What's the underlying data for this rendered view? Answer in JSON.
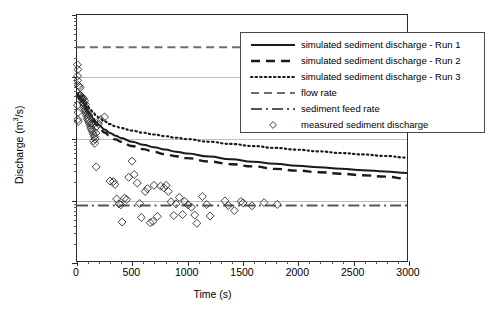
{
  "chart_data": {
    "type": "scatter",
    "title": "",
    "xlabel": "Time (s)",
    "ylabel_text": "Discharge (m",
    "ylabel_sup": "3",
    "ylabel_tail": "/s)",
    "ylabel_full": "Discharge (m3/s)",
    "xlim": [
      0,
      3000
    ],
    "ylim": [
      1e-07,
      0.001
    ],
    "yscale": "log",
    "grid": "horizontal-major",
    "legend_position": "upper-right-inside",
    "xticks": [
      0,
      500,
      1000,
      1500,
      2000,
      2500,
      3000
    ],
    "xtick_labels": [
      "0",
      "500",
      "1000",
      "1500",
      "2000",
      "2500",
      "3000"
    ],
    "xtick_minor_step": 100,
    "yticks": [
      0.001,
      0.0001,
      1e-05,
      1e-06,
      1e-07
    ],
    "ytick_labels": [
      "1.E-03",
      "1.E-04",
      "1.E-05",
      "1.E-06",
      "1.E-07"
    ],
    "series": [
      {
        "name": "simulated sediment discharge - Run 1",
        "style": "solid",
        "color": "#1a1a1a",
        "width": 2.0,
        "x": [
          0,
          25,
          50,
          75,
          100,
          125,
          150,
          175,
          200,
          250,
          300,
          350,
          400,
          500,
          600,
          700,
          800,
          900,
          1000,
          1200,
          1400,
          1600,
          1800,
          2000,
          2200,
          2400,
          2600,
          2800,
          3000
        ],
        "y": [
          5.2e-05,
          4.7e-05,
          4e-05,
          3.3e-05,
          2.75e-05,
          2.35e-05,
          2.05e-05,
          1.82e-05,
          1.63e-05,
          1.38e-05,
          1.21e-05,
          1.09e-05,
          1e-05,
          8.7e-06,
          7.8e-06,
          7.1e-06,
          6.5e-06,
          6e-06,
          5.6e-06,
          5e-06,
          4.5e-06,
          4.1e-06,
          3.8e-06,
          3.55e-06,
          3.35e-06,
          3.15e-06,
          3e-06,
          2.85e-06,
          2.7e-06
        ]
      },
      {
        "name": "simulated sediment discharge - Run 2",
        "style": "dashed",
        "color": "#1a1a1a",
        "width": 2.4,
        "x": [
          0,
          25,
          50,
          75,
          100,
          125,
          150,
          175,
          200,
          250,
          300,
          350,
          400,
          500,
          600,
          700,
          800,
          900,
          1000,
          1200,
          1400,
          1600,
          1800,
          2000,
          2200,
          2400,
          2600,
          2800,
          3000
        ],
        "y": [
          5e-05,
          4.4e-05,
          3.7e-05,
          3.05e-05,
          2.55e-05,
          2.15e-05,
          1.87e-05,
          1.65e-05,
          1.47e-05,
          1.23e-05,
          1.07e-05,
          9.5e-06,
          8.7e-06,
          7.4e-06,
          6.6e-06,
          5.95e-06,
          5.45e-06,
          5.05e-06,
          4.7e-06,
          4.15e-06,
          3.75e-06,
          3.45e-06,
          3.15e-06,
          2.95e-06,
          2.78e-06,
          2.62e-06,
          2.48e-06,
          2.35e-06,
          2.2e-06
        ]
      },
      {
        "name": "simulated sediment discharge - Run 3",
        "style": "dotted",
        "color": "#1a1a1a",
        "width": 2.2,
        "x": [
          0,
          25,
          50,
          75,
          100,
          125,
          150,
          175,
          200,
          250,
          300,
          350,
          400,
          500,
          600,
          700,
          800,
          900,
          1000,
          1200,
          1400,
          1600,
          1800,
          2000,
          2200,
          2400,
          2600,
          2800,
          3000
        ],
        "y": [
          5.3e-05,
          4.9e-05,
          4.3e-05,
          3.7e-05,
          3.2e-05,
          2.85e-05,
          2.55e-05,
          2.32e-05,
          2.13e-05,
          1.86e-05,
          1.68e-05,
          1.55e-05,
          1.45e-05,
          1.32e-05,
          1.22e-05,
          1.14e-05,
          1.07e-05,
          1.01e-05,
          9.6e-06,
          8.7e-06,
          8e-06,
          7.4e-06,
          6.9e-06,
          6.45e-06,
          6.05e-06,
          5.7e-06,
          5.4e-06,
          5.1e-06,
          4.8e-06
        ]
      },
      {
        "name": "flow rate",
        "style": "dashed-light",
        "color": "#6e6e6e",
        "width": 2.0,
        "constant_y": 0.0003
      },
      {
        "name": "sediment feed rate",
        "style": "dash-dot",
        "color": "#555555",
        "width": 2.0,
        "constant_y": 8e-07
      }
    ],
    "scatter": {
      "name": "measured sediment discharge",
      "marker": "diamond-open",
      "color": "#2b2b2b",
      "size": 5.2,
      "points": [
        [
          3,
          0.000155
        ],
        [
          8,
          0.00013
        ],
        [
          5,
          0.000102
        ],
        [
          6,
          8.6e-05
        ],
        [
          12,
          7.2e-05
        ],
        [
          20,
          6.9e-05
        ],
        [
          30,
          6.6e-05
        ],
        [
          4,
          3.4e-05
        ],
        [
          9,
          2.6e-05
        ],
        [
          7,
          2e-05
        ],
        [
          11,
          1.85e-05
        ],
        [
          22,
          4.8e-05
        ],
        [
          28,
          5e-05
        ],
        [
          34,
          4.9e-05
        ],
        [
          40,
          4.6e-05
        ],
        [
          45,
          4.3e-05
        ],
        [
          52,
          3.9e-05
        ],
        [
          58,
          3.6e-05
        ],
        [
          62,
          3.3e-05
        ],
        [
          68,
          3e-05
        ],
        [
          74,
          2.8e-05
        ],
        [
          80,
          2.55e-05
        ],
        [
          86,
          2.35e-05
        ],
        [
          60,
          4.4e-05
        ],
        [
          70,
          4e-05
        ],
        [
          78,
          3.5e-05
        ],
        [
          92,
          2.15e-05
        ],
        [
          98,
          2e-05
        ],
        [
          104,
          1.9e-05
        ],
        [
          110,
          1.75e-05
        ],
        [
          118,
          1.6e-05
        ],
        [
          126,
          1.45e-05
        ],
        [
          100,
          2.6e-05
        ],
        [
          108,
          2.35e-05
        ],
        [
          134,
          1.35e-05
        ],
        [
          142,
          1.25e-05
        ],
        [
          150,
          1.15e-05
        ],
        [
          132,
          1.75e-05
        ],
        [
          140,
          1.62e-05
        ],
        [
          158,
          1.05e-05
        ],
        [
          166,
          9.6e-06
        ],
        [
          150,
          9e-06
        ],
        [
          160,
          8.2e-06
        ],
        [
          172,
          1.2e-05
        ],
        [
          180,
          1.55e-05
        ],
        [
          196,
          1.7e-05
        ],
        [
          215,
          2e-05
        ],
        [
          250,
          2.2e-05
        ],
        [
          175,
          3.4e-06
        ],
        [
          300,
          2e-06
        ],
        [
          330,
          1.95e-06
        ],
        [
          345,
          1.75e-06
        ],
        [
          360,
          1.02e-06
        ],
        [
          382,
          8.5e-07
        ],
        [
          398,
          8.2e-07
        ],
        [
          410,
          4.3e-07
        ],
        [
          432,
          1.05e-06
        ],
        [
          452,
          1e-06
        ],
        [
          470,
          2.3e-06
        ],
        [
          500,
          4.2e-06
        ],
        [
          520,
          2.55e-06
        ],
        [
          548,
          1.85e-06
        ],
        [
          570,
          8.6e-07
        ],
        [
          585,
          5.1e-07
        ],
        [
          620,
          1.35e-06
        ],
        [
          640,
          1.5e-06
        ],
        [
          665,
          4.2e-07
        ],
        [
          690,
          4.4e-07
        ],
        [
          700,
          1.7e-06
        ],
        [
          730,
          5.3e-07
        ],
        [
          760,
          1.65e-06
        ],
        [
          790,
          1.55e-06
        ],
        [
          810,
          1.7e-06
        ],
        [
          830,
          1.35e-06
        ],
        [
          855,
          9.2e-07
        ],
        [
          880,
          5.5e-07
        ],
        [
          900,
          8.5e-07
        ],
        [
          930,
          1.08e-06
        ],
        [
          960,
          5.7e-07
        ],
        [
          980,
          9.3e-07
        ],
        [
          1010,
          8.2e-07
        ],
        [
          1040,
          7.5e-07
        ],
        [
          1070,
          5.6e-07
        ],
        [
          1090,
          4.1e-07
        ],
        [
          1140,
          1.12e-06
        ],
        [
          1180,
          8.3e-07
        ],
        [
          1210,
          5.4e-07
        ],
        [
          1345,
          9.5e-07
        ],
        [
          1375,
          8e-07
        ],
        [
          1430,
          6.6e-07
        ],
        [
          1490,
          9.3e-07
        ],
        [
          1510,
          8.8e-07
        ],
        [
          1590,
          7.9e-07
        ],
        [
          1700,
          8.9e-07
        ],
        [
          1820,
          8.3e-07
        ]
      ]
    }
  },
  "legend": {
    "entries": [
      {
        "label": "simulated sediment discharge - Run 1",
        "key": "solid"
      },
      {
        "label": "simulated sediment discharge - Run 2",
        "key": "dashed"
      },
      {
        "label": "simulated sediment discharge - Run 3",
        "key": "dotted"
      },
      {
        "label": "flow rate",
        "key": "dashed-light"
      },
      {
        "label": "sediment feed rate",
        "key": "dash-dot"
      },
      {
        "label": "measured sediment discharge",
        "key": "diamond-open"
      }
    ]
  }
}
